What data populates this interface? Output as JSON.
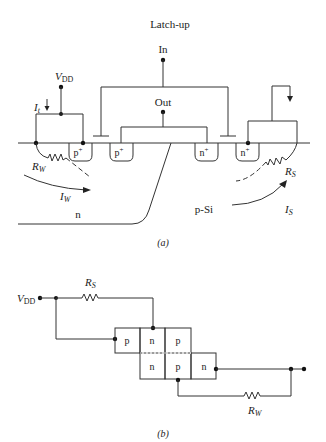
{
  "title": "Latch-up",
  "part_a": {
    "caption": "(a)",
    "labels": {
      "in": "In",
      "out": "Out",
      "vdd_v": "V",
      "vdd_sub": "DD",
      "it_i": "I",
      "it_sub": "t",
      "rw_r": "R",
      "rw_sub": "W",
      "iw_i": "I",
      "iw_sub": "W",
      "rs_r": "R",
      "rs_sub": "S",
      "is_i": "I",
      "is_sub": "S",
      "n_well": "n",
      "p_sub": "p-Si"
    },
    "diffusions": [
      {
        "label": "p",
        "sup": "+"
      },
      {
        "label": "p",
        "sup": "+"
      },
      {
        "label": "n",
        "sup": "+"
      },
      {
        "label": "n",
        "sup": "+"
      }
    ]
  },
  "part_b": {
    "caption": "(b)",
    "labels": {
      "vdd_v": "V",
      "vdd_sub": "DD",
      "rs_r": "R",
      "rs_sub": "S",
      "rw_r": "R",
      "rw_sub": "W"
    },
    "cells_top": [
      "p",
      "n",
      "p"
    ],
    "cells_bottom": [
      "n",
      "p",
      "n"
    ]
  }
}
